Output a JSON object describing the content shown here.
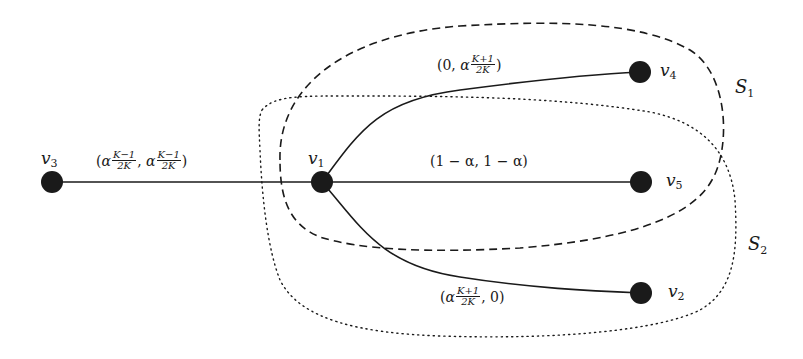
{
  "diagram": {
    "type": "graph",
    "nodes": [
      {
        "id": "v3",
        "name": "v",
        "sub": "3",
        "x": 52,
        "y": 182
      },
      {
        "id": "v1",
        "name": "v",
        "sub": "1",
        "x": 322,
        "y": 182
      },
      {
        "id": "v4",
        "name": "v",
        "sub": "4",
        "x": 640,
        "y": 72
      },
      {
        "id": "v5",
        "name": "v",
        "sub": "5",
        "x": 641,
        "y": 182
      },
      {
        "id": "v2",
        "name": "v",
        "sub": "2",
        "x": 641,
        "y": 293
      }
    ],
    "edges": [
      {
        "from": "v3",
        "to": "v1",
        "label": "(α(K−1)/(2K), α(K−1)/(2K))"
      },
      {
        "from": "v1",
        "to": "v4",
        "label": "(0, α(K+1)/(2K))"
      },
      {
        "from": "v1",
        "to": "v5",
        "label": "(1 − α, 1 − α)"
      },
      {
        "from": "v1",
        "to": "v2",
        "label": "(α(K+1)/(2K), 0)"
      }
    ],
    "sets": [
      {
        "name": "S",
        "sub": "1",
        "style": "dashed",
        "members": [
          "v1",
          "v4",
          "v5"
        ]
      },
      {
        "name": "S",
        "sub": "2",
        "style": "dotted",
        "members": [
          "v1",
          "v5",
          "v2"
        ]
      }
    ]
  },
  "labels": {
    "v3": {
      "name": "v",
      "sub": "3"
    },
    "v1": {
      "name": "v",
      "sub": "1"
    },
    "v4": {
      "name": "v",
      "sub": "4"
    },
    "v5": {
      "name": "v",
      "sub": "5"
    },
    "v2": {
      "name": "v",
      "sub": "2"
    },
    "S1": {
      "name": "S",
      "sub": "1"
    },
    "S2": {
      "name": "S",
      "sub": "2"
    },
    "edge_v3_v1": {
      "open": "(",
      "alpha1": "α",
      "num1": "K−1",
      "den1": "2K",
      "sep": ", ",
      "alpha2": "α",
      "num2": "K−1",
      "den2": "2K",
      "close": ")"
    },
    "edge_v1_v4": {
      "open": "(0, ",
      "alpha": "α",
      "num": "K+1",
      "den": "2K",
      "close": ")"
    },
    "edge_v1_v5": {
      "text": "(1 − α, 1 − α)"
    },
    "edge_v1_v2": {
      "open": "(",
      "alpha": "α",
      "num": "K+1",
      "den": "2K",
      "close": ", 0)"
    }
  },
  "colors": {
    "ink": "#1a1a1a",
    "background": "#ffffff"
  }
}
